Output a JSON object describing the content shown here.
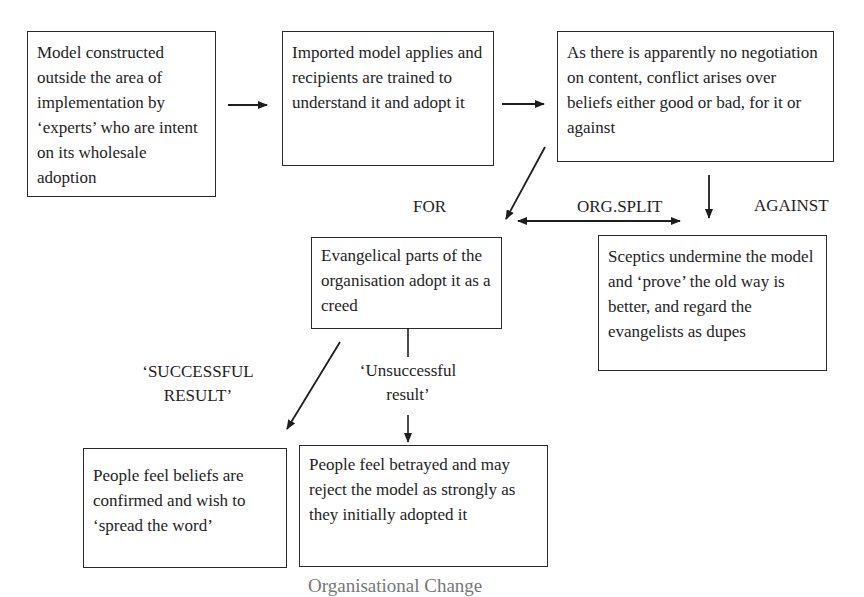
{
  "diagram": {
    "boxes": {
      "model_constructed": "Model constructed outside the area of implementation by ‘experts’ who are intent on its wholesale adoption",
      "imported_model": "Imported model applies and recipients are trained to understand it and adopt it",
      "conflict": "As there is apparently no negotiation on content, conflict arises over beliefs either good or bad, for it or against",
      "evangelical": "Evangelical parts of the organisation adopt it as a creed",
      "sceptics": "Sceptics undermine the model and ‘prove’ the old way is better, and regard the evangelists as dupes",
      "beliefs_confirmed": "People feel beliefs are confirmed and wish to ‘spread the word’",
      "betrayed": "People feel betrayed and may reject the model as strongly as they initially adopted it"
    },
    "labels": {
      "for": "FOR",
      "org_split": "ORG.SPLIT",
      "against": "AGAINST",
      "successful_line1": "‘SUCCESSFUL",
      "successful_line2": "RESULT’",
      "unsuccessful_line1": "‘Unsuccessful",
      "unsuccessful_line2": "result’"
    },
    "caption": "Organisational Change",
    "colors": {
      "line": "#1e1e1e",
      "text": "#1e1e1e",
      "background": "#ffffff"
    }
  }
}
